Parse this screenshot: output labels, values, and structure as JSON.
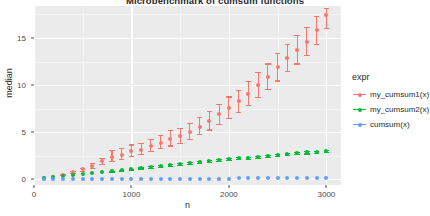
{
  "chart_data": {
    "type": "scatter",
    "title": "Microbenchmark of cumsum functions",
    "xlabel": "n",
    "ylabel": "median",
    "xlim": [
      0,
      3150
    ],
    "ylim": [
      -0.6,
      18.4
    ],
    "xticks": [
      0,
      1000,
      2000,
      3000
    ],
    "xtick_labels": [
      "0",
      "1000",
      "2000",
      "3000"
    ],
    "yticks": [
      0,
      5,
      10,
      15
    ],
    "ytick_labels": [
      "0",
      "5",
      "10",
      "15"
    ],
    "grid": true,
    "legend_position": "right",
    "legend_title": "expr",
    "x": [
      100,
      200,
      300,
      400,
      500,
      600,
      700,
      800,
      900,
      1000,
      1100,
      1200,
      1300,
      1400,
      1500,
      1600,
      1700,
      1800,
      1900,
      2000,
      2100,
      2200,
      2300,
      2400,
      2500,
      2600,
      2700,
      2800,
      2900,
      3000
    ],
    "series": [
      {
        "name": "my_cumsum1(x)",
        "color": "#F8766D",
        "values": [
          0.12,
          0.3,
          0.5,
          0.75,
          1.05,
          1.45,
          1.9,
          2.4,
          2.6,
          3.0,
          3.15,
          3.5,
          3.9,
          4.3,
          4.6,
          5.0,
          5.6,
          6.2,
          6.9,
          7.6,
          8.3,
          9.1,
          10.0,
          10.9,
          11.9,
          12.9,
          13.7,
          14.6,
          15.8,
          17.4
        ],
        "err_low": [
          0.1,
          0.25,
          0.42,
          0.64,
          0.9,
          1.25,
          1.6,
          2.0,
          2.2,
          2.5,
          2.7,
          3.0,
          3.3,
          3.6,
          3.9,
          4.25,
          4.8,
          5.3,
          5.9,
          6.5,
          7.2,
          7.9,
          8.7,
          9.6,
          10.5,
          11.5,
          12.3,
          13.2,
          14.4,
          16.1
        ],
        "err_high": [
          0.15,
          0.36,
          0.6,
          0.9,
          1.25,
          1.7,
          2.3,
          3.1,
          3.3,
          3.7,
          3.9,
          4.3,
          4.7,
          5.2,
          5.5,
          6.0,
          6.6,
          7.3,
          8.0,
          8.8,
          9.5,
          10.4,
          11.4,
          12.3,
          13.4,
          14.4,
          15.3,
          16.2,
          17.3,
          18.2
        ]
      },
      {
        "name": "my_cumsum2(x)",
        "color": "#00BA38",
        "values": [
          0.1,
          0.2,
          0.31,
          0.42,
          0.53,
          0.64,
          0.75,
          0.86,
          0.97,
          1.08,
          1.19,
          1.3,
          1.41,
          1.52,
          1.63,
          1.74,
          1.85,
          1.96,
          2.05,
          2.14,
          2.23,
          2.3,
          2.38,
          2.45,
          2.55,
          2.68,
          2.78,
          2.86,
          2.93,
          3.0
        ],
        "err_low": [
          0.08,
          0.17,
          0.28,
          0.38,
          0.49,
          0.6,
          0.7,
          0.8,
          0.91,
          1.02,
          1.13,
          1.23,
          1.34,
          1.45,
          1.56,
          1.66,
          1.77,
          1.87,
          1.96,
          2.05,
          2.13,
          2.2,
          2.28,
          2.35,
          2.44,
          2.55,
          2.66,
          2.75,
          2.83,
          2.9
        ],
        "err_high": [
          0.13,
          0.24,
          0.35,
          0.47,
          0.58,
          0.69,
          0.81,
          0.93,
          1.04,
          1.15,
          1.26,
          1.38,
          1.49,
          1.6,
          1.71,
          1.83,
          1.94,
          2.06,
          2.15,
          2.24,
          2.34,
          2.41,
          2.49,
          2.56,
          2.67,
          2.82,
          2.91,
          2.98,
          3.04,
          3.11
        ]
      },
      {
        "name": "cumsum(x)",
        "color": "#619CFF",
        "values": [
          0.02,
          0.02,
          0.03,
          0.03,
          0.03,
          0.04,
          0.04,
          0.04,
          0.05,
          0.05,
          0.05,
          0.06,
          0.06,
          0.06,
          0.07,
          0.07,
          0.07,
          0.08,
          0.08,
          0.08,
          0.09,
          0.09,
          0.09,
          0.1,
          0.1,
          0.1,
          0.11,
          0.11,
          0.11,
          0.12
        ],
        "err_low": [
          0.01,
          0.01,
          0.02,
          0.02,
          0.02,
          0.03,
          0.03,
          0.03,
          0.04,
          0.04,
          0.04,
          0.05,
          0.05,
          0.05,
          0.06,
          0.06,
          0.06,
          0.07,
          0.07,
          0.07,
          0.08,
          0.08,
          0.08,
          0.09,
          0.09,
          0.09,
          0.1,
          0.1,
          0.1,
          0.11
        ],
        "err_high": [
          0.03,
          0.03,
          0.04,
          0.04,
          0.04,
          0.05,
          0.05,
          0.05,
          0.06,
          0.06,
          0.06,
          0.07,
          0.07,
          0.07,
          0.08,
          0.08,
          0.08,
          0.09,
          0.09,
          0.09,
          0.1,
          0.1,
          0.1,
          0.11,
          0.11,
          0.11,
          0.12,
          0.12,
          0.12,
          0.13
        ]
      }
    ]
  },
  "panel": {
    "background": "#ebebeb",
    "gridline_major": "#ffffff",
    "gridline_minor": "#f5f5f5"
  }
}
